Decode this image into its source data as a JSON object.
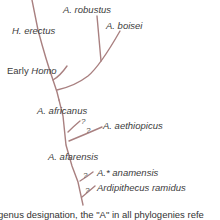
{
  "diagram": {
    "type": "phylogeny",
    "line_color": "#a98080",
    "taxa": {
      "a_robustus": "A. robustus",
      "a_boisei": "A. boisei",
      "h_erectus": "H. erectus",
      "early_homo_prefix": "Early ",
      "early_homo_genus": "Homo",
      "a_africanus": "A. africanus",
      "a_aethiopicus": "A. aethiopicus",
      "a_afarensis": "A. afarensis",
      "a_anamensis": "A.* anamensis",
      "ardipithecus_ramidus": "Ardipithecus ramidus"
    },
    "uncertainty_marks": [
      "?",
      "?",
      "?",
      "?"
    ],
    "caption": "genus designation, the \"A\" in all phylogenies refe"
  }
}
